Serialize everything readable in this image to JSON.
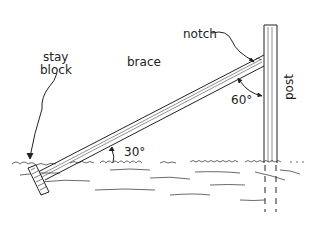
{
  "diagram": {
    "labels": {
      "notch": "notch",
      "post": "post",
      "brace": "brace",
      "stay_line1": "stay",
      "stay_line2": "block",
      "angle_top": "60°",
      "angle_bottom": "30°"
    },
    "colors": {
      "ink": "#222222",
      "background": "#ffffff"
    }
  }
}
